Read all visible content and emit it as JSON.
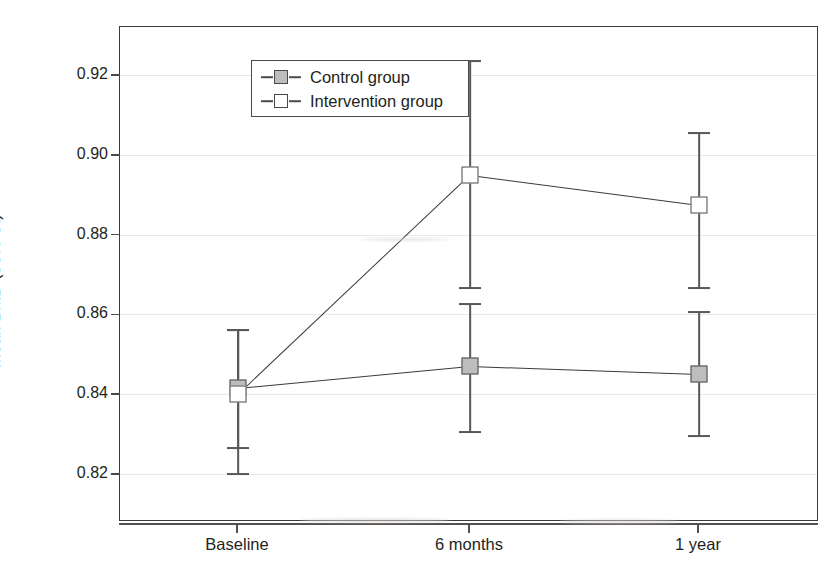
{
  "chart_data": {
    "type": "line",
    "title": "",
    "xlabel": "",
    "ylabel": "Mean BMD (95% CI)",
    "categories": [
      "Baseline",
      "6 months",
      "1 year"
    ],
    "ylim": [
      0.808,
      0.932
    ],
    "yticks": [
      0.82,
      0.84,
      0.86,
      0.88,
      0.9,
      0.92
    ],
    "ytick_labels": [
      "0.82",
      "0.84",
      "0.86",
      "0.88",
      "0.90",
      "0.92"
    ],
    "grid": true,
    "legend_position": "top-left",
    "series": [
      {
        "name": "Control group",
        "marker": "filled-square",
        "marker_color": "#bdbdbd",
        "values": [
          0.8415,
          0.847,
          0.845
        ],
        "ci_lower": [
          0.8265,
          0.8305,
          0.8295
        ],
        "ci_upper": [
          0.856,
          0.8625,
          0.8605
        ]
      },
      {
        "name": "Intervention group",
        "marker": "open-square",
        "marker_color": "#ffffff",
        "values": [
          0.84,
          0.895,
          0.8875
        ],
        "ci_lower": [
          0.82,
          0.8665,
          0.8665
        ],
        "ci_upper": [
          0.856,
          0.9235,
          0.9055
        ]
      }
    ]
  },
  "legend": {
    "entries": [
      {
        "label": "Control group",
        "style": "control"
      },
      {
        "label": "Intervention group",
        "style": "intervention"
      }
    ]
  },
  "axis": {
    "y_title": "Mean BMD (95% CI)",
    "y_tick_labels": [
      "0.92",
      "0.90",
      "0.88",
      "0.86",
      "0.84",
      "0.82"
    ],
    "x_tick_labels": [
      "Baseline",
      "6 months",
      "1 year"
    ]
  },
  "colors": {
    "frame": "#3b3b3b",
    "grid": "#e8e8e8",
    "line": "#3a3a3a",
    "control_fill": "#bdbdbd",
    "intervention_fill": "#ffffff",
    "text": "#231f20"
  }
}
